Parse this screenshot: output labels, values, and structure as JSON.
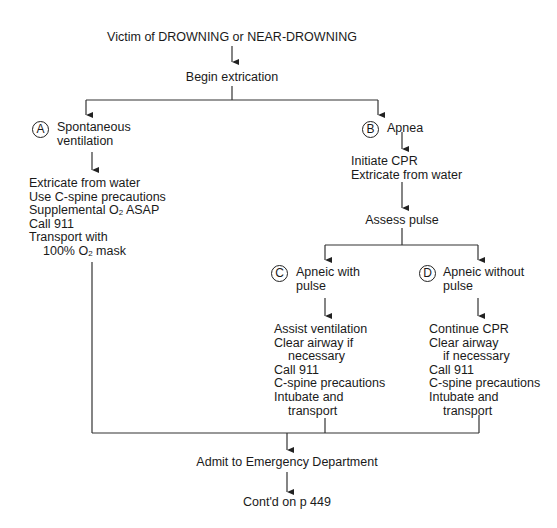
{
  "title": "Victim of DROWNING or NEAR-DROWNING",
  "step1": "Begin extrication",
  "branch_a": {
    "marker": "A",
    "label_lines": [
      "Spontaneous",
      "ventilation"
    ],
    "actions": [
      "Extricate from water",
      "Use C-spine precautions",
      "Supplemental O",
      "2",
      " ASAP",
      "Call 911",
      "Transport with",
      "100% O",
      "2",
      " mask"
    ]
  },
  "branch_b": {
    "marker": "B",
    "label": "Apnea",
    "actions": [
      "Initiate CPR",
      "Extricate from water"
    ],
    "next": "Assess pulse"
  },
  "branch_c": {
    "marker": "C",
    "label_lines": [
      "Apneic with",
      "pulse"
    ],
    "actions": [
      "Assist ventilation",
      "Clear airway if",
      "necessary",
      "Call 911",
      "C-spine precautions",
      "Intubate and",
      "transport"
    ]
  },
  "branch_d": {
    "marker": "D",
    "label_lines": [
      "Apneic without",
      "pulse"
    ],
    "actions": [
      "Continue CPR",
      "Clear airway",
      "if necessary",
      "Call 911",
      "C-spine precautions",
      "Intubate and",
      "transport"
    ]
  },
  "outcome": "Admit to Emergency Department",
  "continuation": "Cont'd on p 449"
}
